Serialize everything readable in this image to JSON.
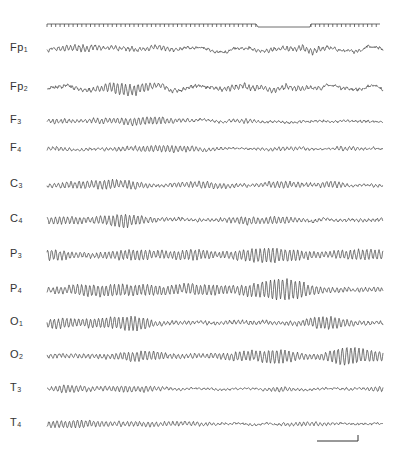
{
  "figure": {
    "type": "EEG recording",
    "time_marker": {
      "y": 24,
      "segments": [
        {
          "kind": "ticks",
          "x_start": 47,
          "x_end": 256,
          "spacing": 4.35
        },
        {
          "kind": "gap",
          "x_start": 256,
          "x_end": 311,
          "drop": 3
        },
        {
          "kind": "ticks",
          "x_start": 311,
          "x_end": 380,
          "spacing": 4.35
        }
      ]
    },
    "channels": [
      {
        "base": "Fp",
        "sub": "1",
        "y": 49,
        "amp": 4.0,
        "alpha": 0.35,
        "seed": 11,
        "style": "frontal-polar"
      },
      {
        "base": "Fp",
        "sub": "2",
        "y": 88,
        "amp": 4.5,
        "alpha": 0.35,
        "seed": 23,
        "style": "frontal-polar"
      },
      {
        "base": "F",
        "sub": "3",
        "y": 121,
        "amp": 3.2,
        "alpha": 0.5,
        "seed": 37,
        "style": "frontal"
      },
      {
        "base": "F",
        "sub": "4",
        "y": 149,
        "amp": 2.8,
        "alpha": 0.5,
        "seed": 41,
        "style": "frontal"
      },
      {
        "base": "C",
        "sub": "3",
        "y": 185,
        "amp": 3.4,
        "alpha": 0.75,
        "seed": 53,
        "style": "central"
      },
      {
        "base": "C",
        "sub": "4",
        "y": 220,
        "amp": 3.4,
        "alpha": 0.75,
        "seed": 67,
        "style": "central"
      },
      {
        "base": "P",
        "sub": "3",
        "y": 255,
        "amp": 4.0,
        "alpha": 1.0,
        "seed": 71,
        "style": "parietal"
      },
      {
        "base": "P",
        "sub": "4",
        "y": 290,
        "amp": 4.2,
        "alpha": 1.0,
        "seed": 83,
        "style": "parietal"
      },
      {
        "base": "O",
        "sub": "1",
        "y": 323,
        "amp": 3.6,
        "alpha": 1.0,
        "seed": 97,
        "style": "occipital"
      },
      {
        "base": "O",
        "sub": "2",
        "y": 356,
        "amp": 3.8,
        "alpha": 1.0,
        "seed": 101,
        "style": "occipital"
      },
      {
        "base": "T",
        "sub": "3",
        "y": 389,
        "amp": 2.4,
        "alpha": 0.7,
        "seed": 113,
        "style": "temporal"
      },
      {
        "base": "T",
        "sub": "4",
        "y": 424,
        "amp": 2.6,
        "alpha": 0.55,
        "seed": 127,
        "style": "temporal"
      }
    ],
    "trace_x_start": 47,
    "trace_x_end": 383,
    "trace_color": "#4a4a4a",
    "scale_bar": {
      "x_start": 317,
      "x_end": 358,
      "y": 441,
      "tick_height": 6
    }
  }
}
